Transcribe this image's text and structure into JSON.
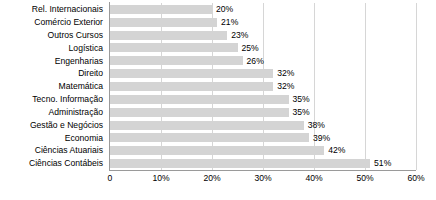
{
  "chart_data": {
    "type": "bar",
    "orientation": "horizontal",
    "title": "",
    "subtitle": "",
    "xlabel": "",
    "ylabel": "",
    "xlim": [
      0,
      60
    ],
    "grid": "vertical",
    "legend": "none",
    "bar_color": "#d4d4d4",
    "axis_color": "#9a9a9a",
    "gridline_color": "#d6d6d6",
    "categories": [
      "Rel. Internacionais",
      "Comércio Exterior",
      "Outros Cursos",
      "Logística",
      "Engenharias",
      "Direito",
      "Matemática",
      "Tecno. Informação",
      "Administração",
      "Gestão e Negócios",
      "Economia",
      "Ciências Atuariais",
      "Ciências Contábeis"
    ],
    "values": [
      20,
      21,
      23,
      25,
      26,
      32,
      32,
      35,
      35,
      38,
      39,
      42,
      51
    ],
    "data_labels": [
      "20%",
      "21%",
      "23%",
      "25%",
      "26%",
      "32%",
      "32%",
      "35%",
      "35%",
      "38%",
      "39%",
      "42%",
      "51%"
    ],
    "xticks": [
      0,
      10,
      20,
      30,
      40,
      50,
      60
    ],
    "xtick_labels": [
      "0",
      "10%",
      "20%",
      "30%",
      "40%",
      "50%",
      "60%"
    ]
  }
}
